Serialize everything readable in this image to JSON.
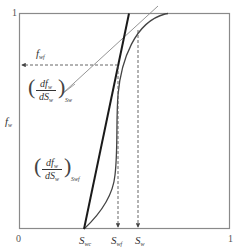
{
  "diagram": {
    "title": "",
    "axes": {
      "origin_label": "0",
      "x_max_label": "1",
      "y_max_label": "1",
      "y_axis_label": "f",
      "y_axis_label_sub": "w"
    },
    "x_tick_labels": [
      {
        "main": "S",
        "sub": "wc"
      },
      {
        "main": "S",
        "sub": "wf"
      },
      {
        "main": "S",
        "sub": "w"
      }
    ],
    "annotations": {
      "fwf_label": {
        "main": "f",
        "sub": "wf"
      },
      "tangent_at_sw": {
        "numerator": "df",
        "numerator_sub": "w",
        "denominator": "dS",
        "denominator_sub": "w",
        "eval_sub": "Sw"
      },
      "tangent_at_swf": {
        "numerator": "df",
        "numerator_sub": "w",
        "denominator": "dS",
        "denominator_sub": "w",
        "eval_sub": "Swf"
      }
    },
    "colors": {
      "frame": "#8a8a8a",
      "curve": "#333333",
      "tangent_bold": "#1a1a1a",
      "tangent_thin": "#777777",
      "dashed": "#555555"
    }
  }
}
